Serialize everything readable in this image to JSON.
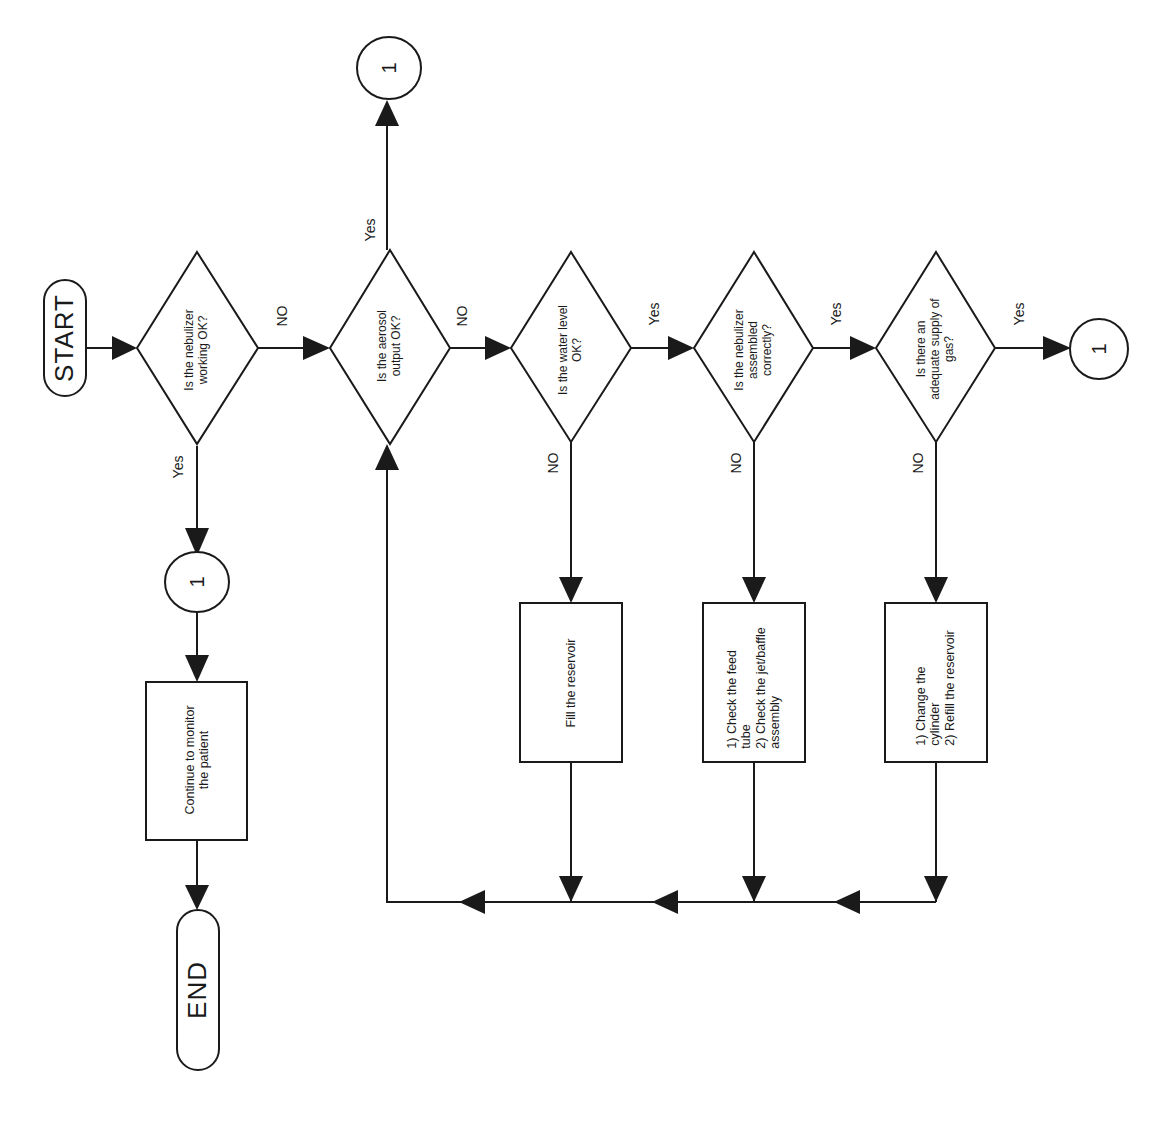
{
  "diagram": {
    "type": "flowchart",
    "orientation": "rotated -90deg",
    "terminals": {
      "start": "START",
      "end": "END"
    },
    "decisions": [
      {
        "id": "d1",
        "text": "Is the nebulizer\nworking OK?"
      },
      {
        "id": "d2",
        "text": "Is the aerosol\noutput OK?"
      },
      {
        "id": "d3",
        "text": "Is the water level\nOK?"
      },
      {
        "id": "d4",
        "text": "Is the nebulizer\nassembled\ncorrectly?"
      },
      {
        "id": "d5",
        "text": "Is there an\nadequate supply of\ngas?"
      }
    ],
    "processes": [
      {
        "id": "p_monitor",
        "text": "Continue to monitor\nthe patient"
      },
      {
        "id": "p_fill",
        "text": "Fill the reservoir"
      },
      {
        "id": "p_check",
        "text": "1) Check the feed\ntube\n2) Check the jet/baffle\nassembly"
      },
      {
        "id": "p_change",
        "text": "1) Change the\ncylinder\n2) Refill the reservoir"
      }
    ],
    "connectors": [
      {
        "id": "c_top",
        "text": "1"
      },
      {
        "id": "c_right",
        "text": "1"
      },
      {
        "id": "c_left",
        "text": "1"
      }
    ],
    "edge_labels": {
      "d1_yes": "Yes",
      "d1_no": "NO",
      "d2_yes": "Yes",
      "d2_no": "NO",
      "d3_yes": "Yes",
      "d3_no": "NO",
      "d4_yes": "Yes",
      "d4_no": "NO",
      "d5_yes": "Yes",
      "d5_no": "NO"
    },
    "edges": [
      {
        "from": "start",
        "to": "d1"
      },
      {
        "from": "d1",
        "to": "c_left",
        "label": "Yes"
      },
      {
        "from": "c_left",
        "to": "p_monitor"
      },
      {
        "from": "p_monitor",
        "to": "end"
      },
      {
        "from": "d1",
        "to": "d2",
        "label": "NO"
      },
      {
        "from": "d2",
        "to": "c_top",
        "label": "Yes"
      },
      {
        "from": "d2",
        "to": "d3",
        "label": "NO"
      },
      {
        "from": "d3",
        "to": "d4",
        "label": "Yes"
      },
      {
        "from": "d3",
        "to": "p_fill",
        "label": "NO"
      },
      {
        "from": "d4",
        "to": "d5",
        "label": "Yes"
      },
      {
        "from": "d4",
        "to": "p_check",
        "label": "NO"
      },
      {
        "from": "d5",
        "to": "c_right",
        "label": "Yes"
      },
      {
        "from": "d5",
        "to": "p_change",
        "label": "NO"
      },
      {
        "from": "p_fill",
        "to": "d2"
      },
      {
        "from": "p_check",
        "to": "d2"
      },
      {
        "from": "p_change",
        "to": "d2"
      }
    ]
  }
}
